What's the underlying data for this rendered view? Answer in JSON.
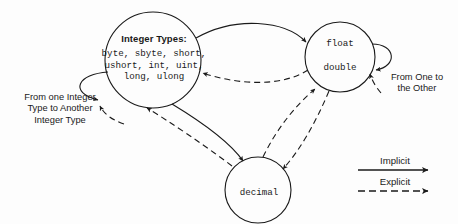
{
  "diagram": {
    "nodes": [
      {
        "id": "integer-types",
        "heading": "Integer Types:",
        "members_line1": "byte, sbyte, short,",
        "members_line2": "ushort, int, uint,",
        "members_line3": "long, ulong"
      },
      {
        "id": "float-double",
        "line1": "float",
        "line2": "double"
      },
      {
        "id": "decimal",
        "label": "decimal"
      }
    ],
    "annotations": {
      "integer_self_line1": "From one Integer",
      "integer_self_line2": "Type to Another",
      "integer_self_line3": "Integer Type",
      "float_self_line1": "From One to",
      "float_self_line2": "the Other"
    },
    "legend": {
      "implicit_label": "Implicit",
      "explicit_label": "Explicit"
    },
    "colors": {
      "stroke": "#1a1a1a",
      "text": "#1a1a1a",
      "background": "#fdfdfd"
    },
    "edges": [
      {
        "from": "integer-types",
        "to": "float-double",
        "kind": "Implicit",
        "style": "solid"
      },
      {
        "from": "float-double",
        "to": "integer-types",
        "kind": "Explicit",
        "style": "dashed"
      },
      {
        "from": "integer-types",
        "to": "decimal",
        "kind": "Implicit",
        "style": "solid"
      },
      {
        "from": "decimal",
        "to": "integer-types",
        "kind": "Explicit",
        "style": "dashed"
      },
      {
        "from": "float-double",
        "to": "decimal",
        "kind": "Explicit",
        "style": "dashed"
      },
      {
        "from": "decimal",
        "to": "float-double",
        "kind": "Explicit",
        "style": "dashed"
      },
      {
        "from": "integer-types",
        "to": "integer-types",
        "kind": "Implicit",
        "style": "solid"
      },
      {
        "from": "integer-types",
        "to": "integer-types",
        "kind": "Explicit",
        "style": "dashed"
      },
      {
        "from": "float-double",
        "to": "float-double",
        "kind": "Implicit",
        "style": "solid"
      },
      {
        "from": "float-double",
        "to": "float-double",
        "kind": "Explicit",
        "style": "dashed"
      }
    ]
  }
}
